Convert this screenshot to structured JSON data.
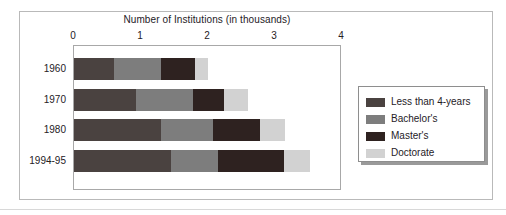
{
  "chart_data": {
    "type": "bar",
    "orientation": "horizontal",
    "stacked": true,
    "title": "Number of Institutions (in thousands)",
    "xlabel": "",
    "ylabel": "",
    "xlim": [
      0,
      4
    ],
    "xticks": [
      "0",
      "1",
      "2",
      "3",
      "4"
    ],
    "grid": false,
    "legend_position": "right",
    "categories": [
      "1960",
      "1970",
      "1980",
      "1994-95"
    ],
    "series": [
      {
        "name": "Less than 4-years",
        "color": "#4a4240",
        "values": [
          0.6,
          0.93,
          1.3,
          1.45
        ]
      },
      {
        "name": "Bachelor's",
        "color": "#7d7d7d",
        "values": [
          0.7,
          0.85,
          0.78,
          0.7
        ]
      },
      {
        "name": "Master's",
        "color": "#2e2220",
        "values": [
          0.5,
          0.46,
          0.69,
          0.98
        ]
      },
      {
        "name": "Doctorate",
        "color": "#d2d2d2",
        "values": [
          0.2,
          0.36,
          0.38,
          0.39
        ]
      }
    ],
    "totals": [
      2.0,
      2.6,
      3.15,
      3.52
    ]
  },
  "legend": {
    "items": [
      {
        "label": "Less than 4-years",
        "color": "#4a4240"
      },
      {
        "label": "Bachelor's",
        "color": "#7d7d7d"
      },
      {
        "label": "Master's",
        "color": "#2e2220"
      },
      {
        "label": "Doctorate",
        "color": "#d2d2d2"
      }
    ]
  },
  "colors": {
    "axis_text": "#25211f",
    "plot_border": "#a8a8a8",
    "figure_border": "#b9b9b9",
    "legend_border": "#8e8e8e",
    "background": "#ffffff"
  }
}
